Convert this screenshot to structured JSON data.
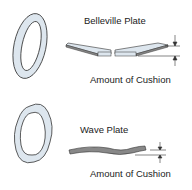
{
  "belleville": {
    "title": "Belleville Plate",
    "dimension_label": "Amount of Cushion"
  },
  "wave": {
    "title": "Wave Plate",
    "dimension_label": "Amount of Cushion"
  },
  "colors": {
    "plate_fill": "#dde6ee",
    "plate_stroke": "#333333",
    "plate_edge": "#888888"
  }
}
